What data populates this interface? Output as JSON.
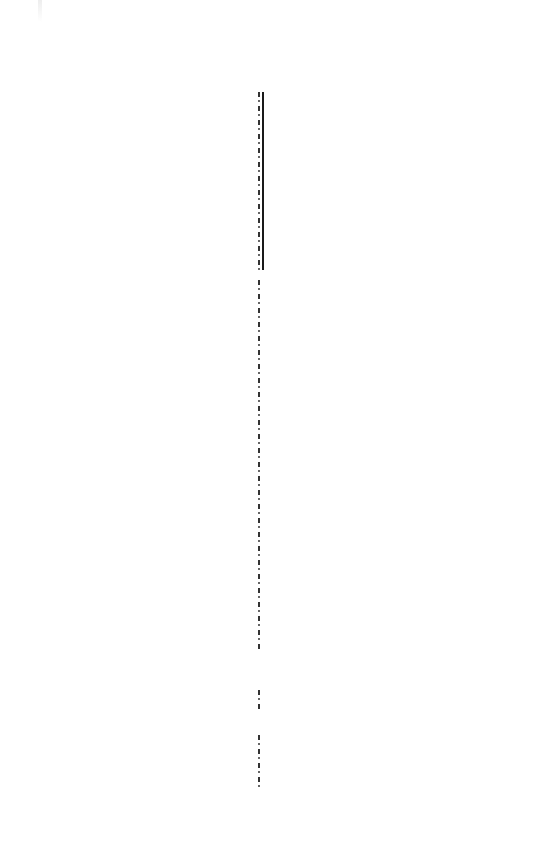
{
  "document": {
    "type": "scanned-page",
    "content": "blank",
    "colors": {
      "background": "#ffffff",
      "gutter": "#1a1a1a"
    }
  }
}
